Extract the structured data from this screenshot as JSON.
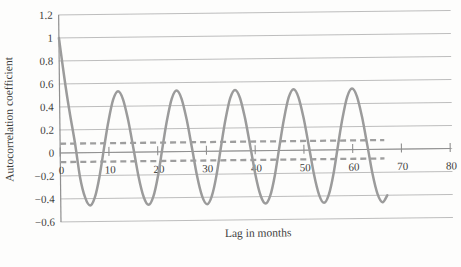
{
  "figure": {
    "background": "#fdfdfc"
  },
  "style": {
    "line_color": "#9b9b9b",
    "bound_color": "#9e9e9e",
    "grid_color": "#b6b6b6",
    "axis_color": "#8f8f8f",
    "text_color": "#3d3d3d"
  },
  "chart_data": {
    "type": "line",
    "title": "",
    "xlabel": "Lag in months",
    "ylabel": "Autocorrelation coefficient",
    "xlim": [
      0,
      80
    ],
    "ylim": [
      -0.6,
      1.2
    ],
    "x_ticks": [
      0,
      10,
      20,
      30,
      40,
      50,
      60,
      70,
      80
    ],
    "x_tick_labels": [
      "0",
      "10",
      "20",
      "30",
      "40",
      "50",
      "60",
      "70",
      "80"
    ],
    "y_ticks": [
      1.2,
      1.0,
      0.8,
      0.6,
      0.4,
      0.2,
      0,
      -0.2,
      -0.4,
      -0.6
    ],
    "y_tick_labels": [
      "1.2",
      "1",
      "0.8",
      "0.6",
      "0.4",
      "0.2",
      "0",
      "−0.2",
      "−0.4",
      "−0.6"
    ],
    "grid": true,
    "legend": "none",
    "series": [
      {
        "name": "autocorrelation",
        "style": "solid-smooth",
        "x": [
          0,
          1,
          2,
          3,
          4,
          5,
          6,
          7,
          8,
          9,
          10,
          11,
          12,
          13,
          14,
          15,
          16,
          17,
          18,
          19,
          20,
          21,
          22,
          23,
          24,
          25,
          26,
          27,
          28,
          29,
          30,
          31,
          32,
          33,
          34,
          35,
          36,
          37,
          38,
          39,
          40,
          41,
          42,
          43,
          44,
          45,
          46,
          47,
          48,
          49,
          50,
          51,
          52,
          53,
          54,
          55,
          56,
          57,
          58,
          59,
          60,
          61,
          62,
          63,
          64,
          65,
          66,
          67
        ],
        "y": [
          1.0,
          0.66,
          0.36,
          0.1,
          -0.21,
          -0.39,
          -0.46,
          -0.39,
          -0.21,
          0.04,
          0.28,
          0.46,
          0.53,
          0.46,
          0.28,
          0.04,
          -0.21,
          -0.39,
          -0.46,
          -0.39,
          -0.21,
          0.04,
          0.28,
          0.46,
          0.53,
          0.46,
          0.28,
          0.04,
          -0.21,
          -0.39,
          -0.46,
          -0.39,
          -0.21,
          0.04,
          0.28,
          0.46,
          0.53,
          0.46,
          0.28,
          0.04,
          -0.21,
          -0.39,
          -0.46,
          -0.39,
          -0.21,
          0.04,
          0.28,
          0.46,
          0.53,
          0.46,
          0.28,
          0.04,
          -0.21,
          -0.39,
          -0.46,
          -0.39,
          -0.21,
          0.04,
          0.28,
          0.46,
          0.53,
          0.46,
          0.28,
          0.04,
          -0.21,
          -0.39,
          -0.46,
          -0.4
        ]
      },
      {
        "name": "upper-confidence-bound",
        "style": "dashed",
        "x": [
          0,
          66.5
        ],
        "y": [
          0.08,
          0.08
        ]
      },
      {
        "name": "lower-confidence-bound",
        "style": "dashed",
        "x": [
          0,
          66.5
        ],
        "y": [
          -0.08,
          -0.08
        ]
      }
    ]
  }
}
